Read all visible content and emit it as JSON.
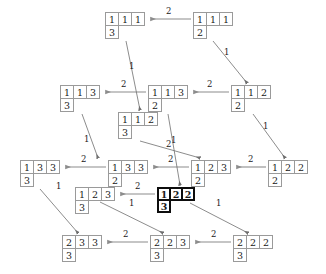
{
  "figure": {
    "type": "crystal-graph",
    "canvas": {
      "width": 326,
      "height": 274
    },
    "colors": {
      "node_border": "#9a9a9a",
      "highlight_border": "#0d0d0d",
      "edge": "#8c8c8c",
      "text": "#1a1a1a",
      "background": "#ffffff"
    }
  },
  "nodes": [
    {
      "id": "n1",
      "name": "tableau-1-1-1-over-3",
      "row1": [
        "1",
        "1",
        "1"
      ],
      "row2": [
        "3"
      ],
      "x": 105,
      "y": 12,
      "highlight": false
    },
    {
      "id": "n2",
      "name": "tableau-1-1-1-over-2",
      "row1": [
        "1",
        "1",
        "1"
      ],
      "row2": [
        "2"
      ],
      "x": 193,
      "y": 12,
      "highlight": false
    },
    {
      "id": "n3",
      "name": "tableau-1-1-3-over-3",
      "row1": [
        "1",
        "1",
        "3"
      ],
      "row2": [
        "3"
      ],
      "x": 60,
      "y": 85,
      "highlight": false
    },
    {
      "id": "n4",
      "name": "tableau-1-1-3-over-2",
      "row1": [
        "1",
        "1",
        "3"
      ],
      "row2": [
        "2"
      ],
      "x": 148,
      "y": 85,
      "highlight": false
    },
    {
      "id": "n5",
      "name": "tableau-1-1-2-over-2",
      "row1": [
        "1",
        "1",
        "2"
      ],
      "row2": [
        "2"
      ],
      "x": 231,
      "y": 85,
      "highlight": false
    },
    {
      "id": "n6",
      "name": "tableau-1-1-2-over-3",
      "row1": [
        "1",
        "1",
        "2"
      ],
      "row2": [
        "3"
      ],
      "x": 118,
      "y": 112,
      "highlight": false
    },
    {
      "id": "n7",
      "name": "tableau-1-3-3-over-3",
      "row1": [
        "1",
        "3",
        "3"
      ],
      "row2": [
        "3"
      ],
      "x": 20,
      "y": 160,
      "highlight": false
    },
    {
      "id": "n8",
      "name": "tableau-1-3-3-over-2",
      "row1": [
        "1",
        "3",
        "3"
      ],
      "row2": [
        "2"
      ],
      "x": 108,
      "y": 160,
      "highlight": false
    },
    {
      "id": "n9",
      "name": "tableau-1-2-3-over-2",
      "row1": [
        "1",
        "2",
        "3"
      ],
      "row2": [
        "2"
      ],
      "x": 191,
      "y": 160,
      "highlight": false
    },
    {
      "id": "n10",
      "name": "tableau-1-2-2-over-2",
      "row1": [
        "1",
        "2",
        "2"
      ],
      "row2": [
        "2"
      ],
      "x": 268,
      "y": 160,
      "highlight": false
    },
    {
      "id": "n11",
      "name": "tableau-1-2-3-over-3",
      "row1": [
        "1",
        "2",
        "3"
      ],
      "row2": [
        "3"
      ],
      "x": 75,
      "y": 187,
      "highlight": false
    },
    {
      "id": "n12",
      "name": "tableau-1-2-2-over-3",
      "row1": [
        "1",
        "2",
        "2"
      ],
      "row2": [
        "3"
      ],
      "x": 157,
      "y": 187,
      "highlight": true
    },
    {
      "id": "n13",
      "name": "tableau-2-3-3-over-3",
      "row1": [
        "2",
        "3",
        "3"
      ],
      "row2": [
        "3"
      ],
      "x": 62,
      "y": 235,
      "highlight": false
    },
    {
      "id": "n14",
      "name": "tableau-2-2-3-over-3",
      "row1": [
        "2",
        "2",
        "3"
      ],
      "row2": [
        "3"
      ],
      "x": 150,
      "y": 235,
      "highlight": false
    },
    {
      "id": "n15",
      "name": "tableau-2-2-2-over-3",
      "row1": [
        "2",
        "2",
        "2"
      ],
      "row2": [
        "3"
      ],
      "x": 233,
      "y": 235,
      "highlight": false
    }
  ],
  "edges": [
    {
      "name": "edge-n2-n1",
      "from": "n2",
      "to": "n1",
      "label": "2",
      "x1": 191,
      "y1": 19,
      "x2": 151,
      "y2": 19,
      "lx": 166,
      "ly": 7
    },
    {
      "name": "edge-n4-n3",
      "from": "n4",
      "to": "n3",
      "label": "2",
      "x1": 146,
      "y1": 92,
      "x2": 106,
      "y2": 92,
      "lx": 121,
      "ly": 80
    },
    {
      "name": "edge-n5-n4",
      "from": "n5",
      "to": "n4",
      "label": "2",
      "x1": 229,
      "y1": 92,
      "x2": 194,
      "y2": 92,
      "lx": 207,
      "ly": 80
    },
    {
      "name": "edge-n8-n7",
      "from": "n8",
      "to": "n7",
      "label": "2",
      "x1": 106,
      "y1": 167,
      "x2": 66,
      "y2": 167,
      "lx": 81,
      "ly": 155
    },
    {
      "name": "edge-n9-n8",
      "from": "n9",
      "to": "n8",
      "label": "2",
      "x1": 189,
      "y1": 167,
      "x2": 154,
      "y2": 167,
      "lx": 168,
      "ly": 155
    },
    {
      "name": "edge-n10-n9",
      "from": "n10",
      "to": "n9",
      "label": "2",
      "x1": 266,
      "y1": 167,
      "x2": 237,
      "y2": 167,
      "lx": 248,
      "ly": 155
    },
    {
      "name": "edge-n12-n11",
      "from": "n12",
      "to": "n11",
      "label": "2",
      "x1": 155,
      "y1": 194,
      "x2": 121,
      "y2": 194,
      "lx": 135,
      "ly": 182
    },
    {
      "name": "edge-n14-n13",
      "from": "n14",
      "to": "n13",
      "label": "2",
      "x1": 148,
      "y1": 242,
      "x2": 108,
      "y2": 242,
      "lx": 123,
      "ly": 230
    },
    {
      "name": "edge-n15-n14",
      "from": "n15",
      "to": "n14",
      "label": "2",
      "x1": 231,
      "y1": 242,
      "x2": 196,
      "y2": 242,
      "lx": 211,
      "ly": 230
    },
    {
      "name": "edge-n1-n6",
      "from": "n1",
      "to": "n6",
      "label": "1",
      "x1": 126,
      "y1": 41,
      "x2": 140,
      "y2": 110,
      "lx": 129,
      "ly": 62
    },
    {
      "name": "edge-n2-n5",
      "from": "n2",
      "to": "n5",
      "label": "1",
      "x1": 213,
      "y1": 41,
      "x2": 247,
      "y2": 83,
      "lx": 224,
      "ly": 48
    },
    {
      "name": "edge-n3-n8",
      "from": "n3",
      "to": "n8",
      "label": "1",
      "x1": 82,
      "y1": 114,
      "x2": 98,
      "y2": 158,
      "lx": 84,
      "ly": 135
    },
    {
      "name": "edge-n4-n12",
      "from": "n4",
      "to": "n12",
      "label": "1",
      "x1": 168,
      "y1": 114,
      "x2": 180,
      "y2": 185,
      "lx": 171,
      "ly": 136
    },
    {
      "name": "edge-n5-n10",
      "from": "n5",
      "to": "n10",
      "label": "1",
      "x1": 253,
      "y1": 114,
      "x2": 285,
      "y2": 158,
      "lx": 263,
      "ly": 122
    },
    {
      "name": "edge-n6-n9",
      "from": "n6",
      "to": "n9",
      "label": "2",
      "x1": 140,
      "y1": 141,
      "x2": 200,
      "y2": 158,
      "lx": 166,
      "ly": 140
    },
    {
      "name": "edge-n7-n13",
      "from": "n7",
      "to": "n13",
      "label": "1",
      "x1": 40,
      "y1": 189,
      "x2": 78,
      "y2": 233,
      "lx": 56,
      "ly": 182
    },
    {
      "name": "edge-n11-n14",
      "from": "n11",
      "to": "n14",
      "label": "1",
      "x1": 100,
      "y1": 202,
      "x2": 163,
      "y2": 233,
      "lx": 129,
      "ly": 199
    },
    {
      "name": "edge-n12-n15",
      "from": "n12",
      "to": "n15",
      "label": "1",
      "x1": 190,
      "y1": 203,
      "x2": 248,
      "y2": 233,
      "lx": 216,
      "ly": 199
    }
  ]
}
